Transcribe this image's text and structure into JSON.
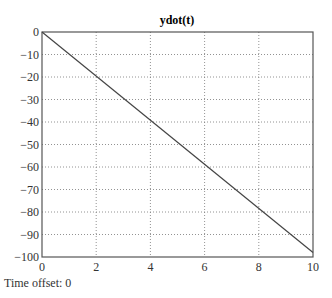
{
  "chart_data": {
    "type": "line",
    "title": "ydot(t)",
    "xlabel": "",
    "ylabel": "",
    "xlim": [
      0,
      10
    ],
    "ylim": [
      -100,
      0
    ],
    "xticks": [
      0,
      2,
      4,
      6,
      8,
      10
    ],
    "yticks": [
      0,
      -10,
      -20,
      -30,
      -40,
      -50,
      -60,
      -70,
      -80,
      -90,
      -100
    ],
    "grid": true,
    "legend": null,
    "series": [
      {
        "name": "ydot(t)",
        "x": [
          0,
          10
        ],
        "y": [
          0,
          -98
        ]
      }
    ]
  },
  "caption": "Time offset: 0"
}
